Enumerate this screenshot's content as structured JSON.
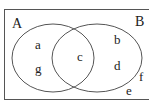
{
  "diagram": {
    "type": "venn",
    "universal_set_label": "",
    "sets": [
      {
        "name": "A",
        "label": "A"
      },
      {
        "name": "B",
        "label": "B"
      }
    ],
    "regions": {
      "A_only": [
        "a",
        "g"
      ],
      "A_and_B": [
        "c"
      ],
      "B_only": [
        "b",
        "d"
      ],
      "outside": [
        "f",
        "e"
      ]
    },
    "colors": {
      "stroke": "#555555",
      "text": "#222222",
      "background": "#ffffff"
    }
  },
  "labels": {
    "A": "A",
    "B": "B",
    "a": "a",
    "g": "g",
    "c": "c",
    "b": "b",
    "d": "d",
    "f": "f",
    "e": "e"
  }
}
